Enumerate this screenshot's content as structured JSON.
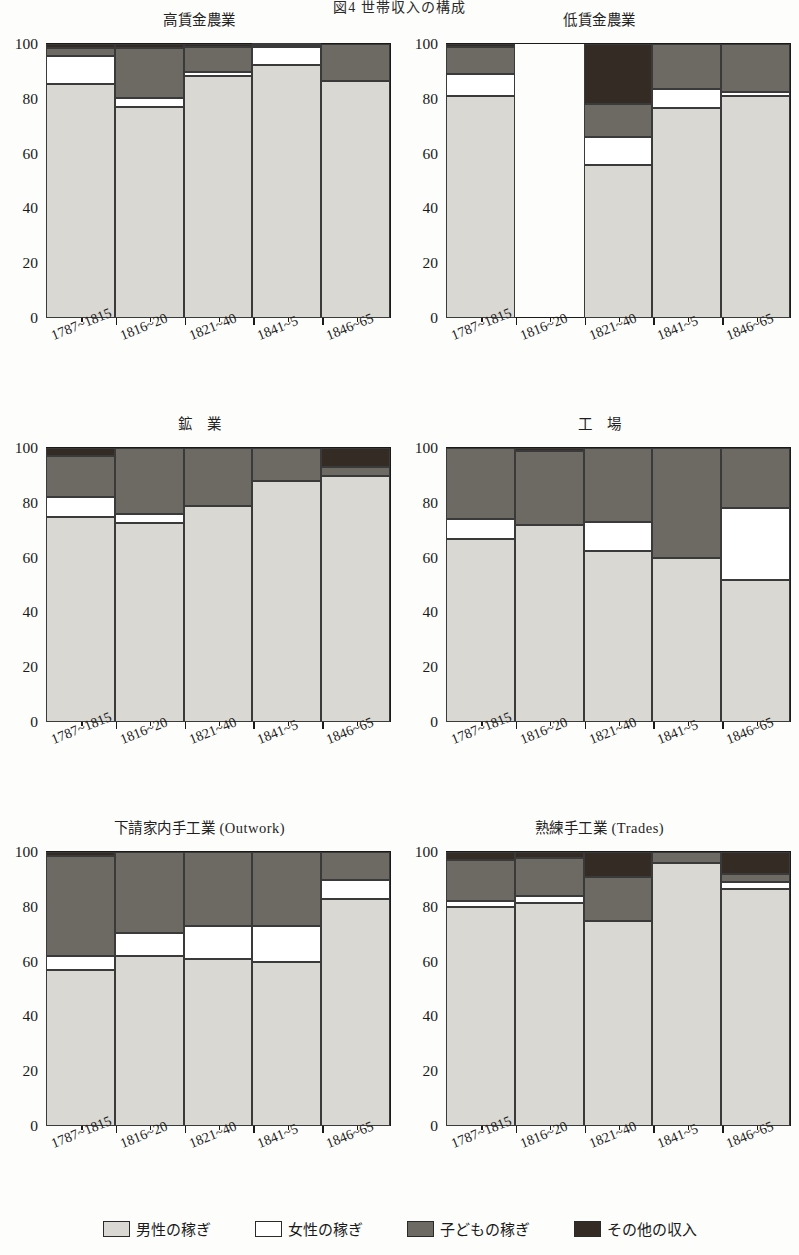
{
  "figure": {
    "title": "図4 世帯収入の構成"
  },
  "axis": {
    "y_ticks": [
      0,
      20,
      40,
      60,
      80,
      100
    ],
    "y_minor_ticks": [
      10,
      30,
      50,
      70,
      90
    ],
    "ylim": [
      0,
      100
    ],
    "categories": [
      "1787~1815",
      "1816~20",
      "1821~40",
      "1841~5",
      "1846~65"
    ]
  },
  "legend": {
    "items": [
      {
        "label": "男性の稼ぎ",
        "color": "#d9d8d2",
        "key": "men"
      },
      {
        "label": "女性の稼ぎ",
        "color": "#ffffff",
        "key": "women"
      },
      {
        "label": "子どもの稼ぎ",
        "color": "#6d6a64",
        "key": "children"
      },
      {
        "label": "その他の収入",
        "color": "#352b25",
        "key": "other"
      }
    ]
  },
  "panels": [
    {
      "id": "high-wage-agriculture",
      "title": "高賃金農業"
    },
    {
      "id": "low-wage-agriculture",
      "title": "低賃金農業"
    },
    {
      "id": "mining",
      "title": "鉱　業"
    },
    {
      "id": "factory",
      "title": "工　場"
    },
    {
      "id": "outwork",
      "title": "下請家内手工業 (Outwork)"
    },
    {
      "id": "trades",
      "title": "熟練手工業 (Trades)"
    }
  ],
  "chart_data": [
    {
      "type": "bar",
      "stacked": true,
      "title": "高賃金農業",
      "xlabel": "",
      "ylabel": "",
      "ylim": [
        0,
        100
      ],
      "grid": false,
      "legend_position": "bottom",
      "categories": [
        "1787~1815",
        "1816~20",
        "1821~40",
        "1841~5",
        "1846~65"
      ],
      "series": [
        {
          "name": "男性の稼ぎ",
          "values": [
            85.5,
            77.0,
            88.5,
            92.5,
            86.5
          ]
        },
        {
          "name": "女性の稼ぎ",
          "values": [
            10.0,
            3.5,
            1.5,
            6.5,
            0.0
          ]
        },
        {
          "name": "子どもの稼ぎ",
          "values": [
            3.0,
            18.0,
            9.0,
            0.5,
            13.5
          ]
        },
        {
          "name": "その他の収入",
          "values": [
            1.5,
            1.5,
            1.0,
            0.5,
            0.0
          ]
        }
      ]
    },
    {
      "type": "bar",
      "stacked": true,
      "title": "低賃金農業",
      "xlabel": "",
      "ylabel": "",
      "ylim": [
        0,
        100
      ],
      "grid": false,
      "legend_position": "bottom",
      "categories": [
        "1787~1815",
        "1816~20",
        "1821~40",
        "1841~5",
        "1846~65"
      ],
      "note": "1816~20 のデータなし",
      "series": [
        {
          "name": "男性の稼ぎ",
          "values": [
            81.0,
            0.0,
            56.0,
            76.5,
            81.0
          ]
        },
        {
          "name": "女性の稼ぎ",
          "values": [
            8.0,
            0.0,
            10.0,
            7.0,
            1.5
          ]
        },
        {
          "name": "子どもの稼ぎ",
          "values": [
            10.0,
            0.0,
            12.0,
            16.5,
            17.5
          ]
        },
        {
          "name": "その他の収入",
          "values": [
            1.0,
            0.0,
            22.0,
            0.0,
            0.0
          ]
        }
      ]
    },
    {
      "type": "bar",
      "stacked": true,
      "title": "鉱　業",
      "xlabel": "",
      "ylabel": "",
      "ylim": [
        0,
        100
      ],
      "grid": false,
      "legend_position": "bottom",
      "categories": [
        "1787~1815",
        "1816~20",
        "1821~40",
        "1841~5",
        "1846~65"
      ],
      "series": [
        {
          "name": "男性の稼ぎ",
          "values": [
            75.0,
            72.5,
            79.0,
            88.0,
            90.0
          ]
        },
        {
          "name": "女性の稼ぎ",
          "values": [
            7.0,
            3.5,
            0.0,
            0.0,
            0.0
          ]
        },
        {
          "name": "子どもの稼ぎ",
          "values": [
            15.0,
            24.0,
            21.0,
            12.0,
            3.0
          ]
        },
        {
          "name": "その他の収入",
          "values": [
            3.0,
            0.0,
            0.0,
            0.0,
            7.0
          ]
        }
      ]
    },
    {
      "type": "bar",
      "stacked": true,
      "title": "工　場",
      "xlabel": "",
      "ylabel": "",
      "ylim": [
        0,
        100
      ],
      "grid": false,
      "legend_position": "bottom",
      "categories": [
        "1787~1815",
        "1816~20",
        "1821~40",
        "1841~5",
        "1846~65"
      ],
      "series": [
        {
          "name": "男性の稼ぎ",
          "values": [
            67.0,
            72.0,
            62.5,
            60.0,
            52.0
          ]
        },
        {
          "name": "女性の稼ぎ",
          "values": [
            7.0,
            0.0,
            10.5,
            0.0,
            26.0
          ]
        },
        {
          "name": "子どもの稼ぎ",
          "values": [
            26.0,
            27.0,
            27.0,
            40.0,
            22.0
          ]
        },
        {
          "name": "その他の収入",
          "values": [
            0.0,
            1.0,
            0.0,
            0.0,
            0.0
          ]
        }
      ]
    },
    {
      "type": "bar",
      "stacked": true,
      "title": "下請家内手工業 (Outwork)",
      "xlabel": "",
      "ylabel": "",
      "ylim": [
        0,
        100
      ],
      "grid": false,
      "legend_position": "bottom",
      "categories": [
        "1787~1815",
        "1816~20",
        "1821~40",
        "1841~5",
        "1846~65"
      ],
      "series": [
        {
          "name": "男性の稼ぎ",
          "values": [
            57.0,
            62.0,
            61.0,
            60.0,
            83.0
          ]
        },
        {
          "name": "女性の稼ぎ",
          "values": [
            5.0,
            8.5,
            12.0,
            13.0,
            7.0
          ]
        },
        {
          "name": "子どもの稼ぎ",
          "values": [
            36.5,
            29.5,
            27.0,
            27.0,
            10.0
          ]
        },
        {
          "name": "その他の収入",
          "values": [
            1.5,
            0.0,
            0.0,
            0.0,
            0.0
          ]
        }
      ]
    },
    {
      "type": "bar",
      "stacked": true,
      "title": "熟練手工業 (Trades)",
      "xlabel": "",
      "ylabel": "",
      "ylim": [
        0,
        100
      ],
      "grid": false,
      "legend_position": "bottom",
      "categories": [
        "1787~1815",
        "1816~20",
        "1821~40",
        "1841~5",
        "1846~65"
      ],
      "series": [
        {
          "name": "男性の稼ぎ",
          "values": [
            80.0,
            81.5,
            75.0,
            96.0,
            86.5
          ]
        },
        {
          "name": "女性の稼ぎ",
          "values": [
            2.0,
            2.5,
            0.0,
            0.0,
            2.5
          ]
        },
        {
          "name": "子どもの稼ぎ",
          "values": [
            15.0,
            14.0,
            16.0,
            4.0,
            3.0
          ]
        },
        {
          "name": "その他の収入",
          "values": [
            3.0,
            2.0,
            9.0,
            0.0,
            8.0
          ]
        }
      ]
    }
  ]
}
